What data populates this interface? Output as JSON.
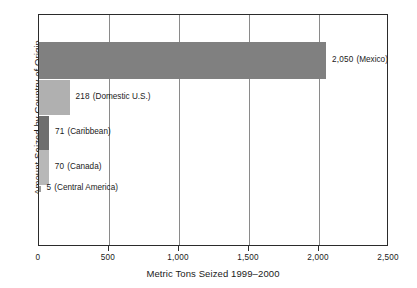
{
  "chart_data": {
    "type": "bar",
    "orientation": "horizontal",
    "title": "",
    "xlabel": "Metric Tons Seized 1999–2000",
    "ylabel": "Amount Seized by Country of Origin",
    "xlim": [
      0,
      2500
    ],
    "xticks": [
      "0",
      "500",
      "1,000",
      "1,500",
      "2,000",
      "2,500"
    ],
    "xtick_values": [
      0,
      500,
      1000,
      1500,
      2000,
      2500
    ],
    "grid": "vertical gridlines at 500, 1,000, 1,500, 2,000",
    "legend": "none",
    "categories": [
      "Mexico",
      "Domestic U.S.",
      "Caribbean",
      "Canada",
      "Central America"
    ],
    "values": [
      2050,
      218,
      71,
      70,
      5
    ],
    "bars": [
      {
        "category": "Mexico",
        "value": 2050,
        "value_text": "2,050",
        "label_paren": "(Mexico)",
        "color": "#808080"
      },
      {
        "category": "Domestic U.S.",
        "value": 218,
        "value_text": "218",
        "label_paren": "(Domestic U.S.)",
        "color": "#b0b0b0"
      },
      {
        "category": "Caribbean",
        "value": 71,
        "value_text": "71",
        "label_paren": "(Caribbean)",
        "color": "#6e6e6e"
      },
      {
        "category": "Canada",
        "value": 70,
        "value_text": "70",
        "label_paren": "(Canada)",
        "color": "#b8b8b8"
      },
      {
        "category": "Central America",
        "value": 5,
        "value_text": "5",
        "label_paren": "(Central America)",
        "color": "#9a9a9a"
      }
    ]
  }
}
